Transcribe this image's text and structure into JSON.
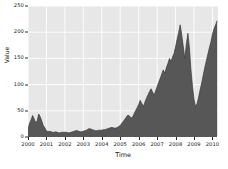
{
  "chart_data": {
    "type": "area",
    "title": "",
    "xlabel": "Time",
    "ylabel": "Value",
    "xlim": [
      2000,
      2010.3
    ],
    "ylim": [
      0,
      250
    ],
    "grid": true,
    "legend": null,
    "colors": {
      "fill": "#575757",
      "line": "#3a3a3a",
      "plot_background": "#e7e7e7",
      "gridline": "#ffffff",
      "figure_background": "#ffffff",
      "text": "#1a1a1a"
    },
    "xticks": [
      2000,
      2001,
      2002,
      2003,
      2004,
      2005,
      2006,
      2007,
      2008,
      2009,
      2010
    ],
    "xtick_labels": [
      "2000",
      "2001",
      "2002",
      "2003",
      "2004",
      "2005",
      "2006",
      "2007",
      "2008",
      "2009",
      "2010"
    ],
    "yticks": [
      0,
      50,
      100,
      150,
      200,
      250
    ],
    "ytick_labels": [
      "0",
      "50",
      "100",
      "150",
      "200",
      "250"
    ],
    "x": [
      2000.0,
      2000.08,
      2000.17,
      2000.25,
      2000.33,
      2000.42,
      2000.5,
      2000.58,
      2000.67,
      2000.75,
      2000.83,
      2000.92,
      2001.0,
      2001.08,
      2001.17,
      2001.25,
      2001.33,
      2001.42,
      2001.5,
      2001.58,
      2001.67,
      2001.75,
      2001.83,
      2001.92,
      2002.0,
      2002.08,
      2002.17,
      2002.25,
      2002.33,
      2002.42,
      2002.5,
      2002.58,
      2002.67,
      2002.75,
      2002.83,
      2002.92,
      2003.0,
      2003.08,
      2003.17,
      2003.25,
      2003.33,
      2003.42,
      2003.5,
      2003.58,
      2003.67,
      2003.75,
      2003.83,
      2003.92,
      2004.0,
      2004.08,
      2004.17,
      2004.25,
      2004.33,
      2004.42,
      2004.5,
      2004.58,
      2004.67,
      2004.75,
      2004.83,
      2004.92,
      2005.0,
      2005.08,
      2005.17,
      2005.25,
      2005.33,
      2005.42,
      2005.5,
      2005.58,
      2005.67,
      2005.75,
      2005.83,
      2005.92,
      2006.0,
      2006.08,
      2006.17,
      2006.25,
      2006.33,
      2006.42,
      2006.5,
      2006.58,
      2006.67,
      2006.75,
      2006.83,
      2006.92,
      2007.0,
      2007.08,
      2007.17,
      2007.25,
      2007.33,
      2007.42,
      2007.5,
      2007.58,
      2007.67,
      2007.75,
      2007.83,
      2007.92,
      2008.0,
      2008.08,
      2008.17,
      2008.25,
      2008.33,
      2008.42,
      2008.5,
      2008.58,
      2008.67,
      2008.75,
      2008.83,
      2008.92,
      2009.0,
      2009.08,
      2009.17,
      2009.25,
      2009.33,
      2009.42,
      2009.5,
      2009.58,
      2009.67,
      2009.75,
      2009.83,
      2009.92,
      2010.0,
      2010.08,
      2010.17,
      2010.25
    ],
    "values": [
      14,
      26,
      33,
      41,
      35,
      27,
      31,
      44,
      38,
      30,
      22,
      17,
      12,
      10,
      11,
      10,
      9,
      9,
      10,
      9,
      8,
      8,
      9,
      9,
      9,
      9,
      8,
      8,
      9,
      10,
      11,
      12,
      12,
      11,
      10,
      10,
      11,
      12,
      13,
      15,
      16,
      15,
      14,
      13,
      12,
      12,
      13,
      13,
      13,
      14,
      14,
      15,
      16,
      17,
      18,
      18,
      17,
      17,
      18,
      20,
      22,
      26,
      30,
      34,
      38,
      42,
      40,
      36,
      38,
      44,
      50,
      56,
      62,
      70,
      64,
      58,
      66,
      74,
      80,
      86,
      92,
      86,
      80,
      88,
      96,
      104,
      112,
      120,
      128,
      122,
      132,
      140,
      150,
      144,
      152,
      160,
      172,
      186,
      200,
      214,
      196,
      172,
      150,
      176,
      198,
      170,
      130,
      96,
      72,
      58,
      64,
      76,
      90,
      104,
      118,
      132,
      146,
      158,
      170,
      182,
      196,
      206,
      214,
      222
    ]
  }
}
